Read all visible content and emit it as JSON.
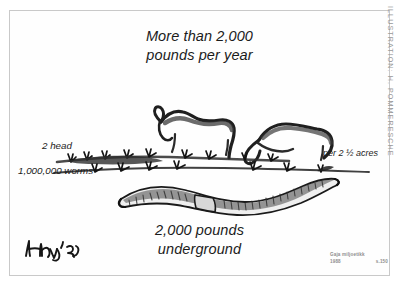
{
  "illustration": {
    "title_line1": "More than 2,000",
    "title_line2": "pounds per year",
    "caption_line1": "2,000 pounds",
    "caption_line2": "underground",
    "label_left_top": "2 head",
    "label_left_bottom": "1,000,000 worms",
    "label_right": "per 2 ½ acres",
    "side_credit": "ILLUSTRATION: H. POMMERESCHE",
    "source_line1": "Gaja miljoetikk",
    "source_year": "1988",
    "source_page": "s.150",
    "signature": "Henry '96"
  },
  "colors": {
    "ink": "#1b1b1b",
    "frame": "#c9c9c9",
    "paper": "#ffffff",
    "muted": "#8e8e8e"
  }
}
